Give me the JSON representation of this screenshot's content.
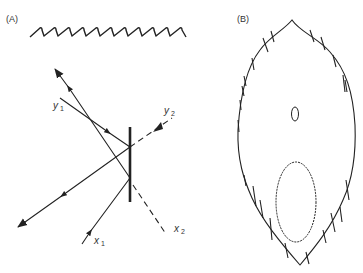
{
  "figure": {
    "panels": [
      {
        "id": "A",
        "label": "(A)",
        "labels": {
          "y1": "y",
          "y1_sub": "1",
          "y2": "y",
          "y2_sub": "2",
          "x1": "x",
          "x1_sub": "1",
          "x2": "x",
          "x2_sub": "2"
        },
        "description": "Wavy fibre above; ray-reflection geometry at a vertical mirror with incident rays y1, x1, reflected rays and dashed transmitted continuations y2, x2"
      },
      {
        "id": "B",
        "label": "(B)",
        "description": "Pointed oval outline with short cross-hatch tick marks, containing a small upper oval and a large lower oval"
      }
    ],
    "colors": {
      "stroke": "#222222",
      "background": "#ffffff"
    }
  }
}
